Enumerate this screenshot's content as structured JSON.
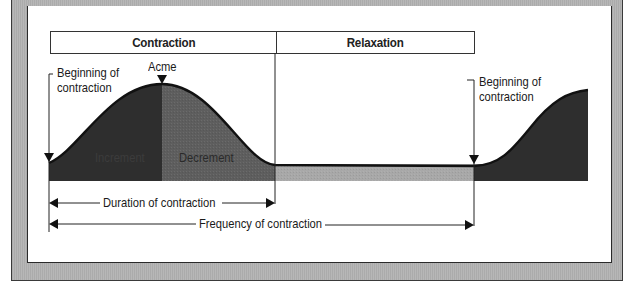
{
  "header": {
    "contraction_label": "Contraction",
    "relaxation_label": "Relaxation"
  },
  "labels": {
    "acme": "Acme",
    "beginning_left_line1": "Beginning of",
    "beginning_left_line2": "contraction",
    "beginning_right_line1": "Beginning of",
    "beginning_right_line2": "contraction",
    "increment": "Increment",
    "decrement": "Decrement",
    "duration": "Duration of contraction",
    "frequency": "Frequency of contraction"
  },
  "colors": {
    "increment_fill": "#2e2e2e",
    "decrement_fill": "#5e5e5e",
    "baseline_band": "#a8a8a8",
    "frame_gray": "#b4b4b4",
    "line": "#1a1a1a"
  }
}
